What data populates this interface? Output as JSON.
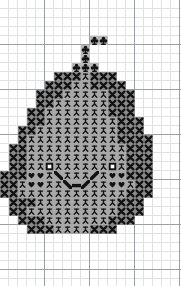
{
  "document": {
    "type": "cross-stitch-chart",
    "title": "Pumpkin Jack-o-Lantern Cross Stitch Chart",
    "width_px": 181,
    "height_px": 286,
    "cell_size_px": 9,
    "grid": {
      "minor_line_color": "#dfe1e3",
      "major_line_color": "#9aa0a6",
      "major_every_cells": 5,
      "columns": 20,
      "rows": 31,
      "show": true
    }
  },
  "legend": {
    "symbols": [
      {
        "key": "x",
        "name": "cross-x-symbol",
        "label": "X",
        "cell_color": "#8a8a8a",
        "ink": "#111111"
      },
      {
        "key": "fig",
        "name": "stick-figure-symbol",
        "label": "Stick figure",
        "cell_color": "#a8a8a8",
        "ink": "#111111"
      },
      {
        "key": "heart",
        "name": "heart-symbol",
        "label": "Heart",
        "cell_color": "#a8a8a8",
        "ink": "#111111"
      },
      {
        "key": "eye",
        "name": "eye-square-symbol",
        "label": "Open square",
        "cell_color": "#a8a8a8",
        "ink": "#ffffff"
      },
      {
        "key": "mouth",
        "name": "mouth-stroke-symbol",
        "label": "Diagonal bar",
        "cell_color": "#a8a8a8",
        "ink": "#111111"
      },
      {
        "key": "club",
        "name": "club-symbol",
        "label": "Club",
        "cell_color": "#b8b8b8",
        "ink": "#111111"
      }
    ]
  },
  "chart_data": {
    "type": "heatmap",
    "xlabel": "",
    "ylabel": "",
    "legend_position": "none",
    "grid": true,
    "origin_x_px": 0,
    "origin_y_px": 0,
    "cell_px": 9,
    "columns": 20,
    "rows": 31,
    "key": {
      "0": "blank",
      "x": "cross",
      "f": "stick-figure",
      "h": "heart",
      "e": "eye",
      "m": "mouth",
      "c": "club"
    },
    "rows_data": [
      "00000000000000000000",
      "00000000000000000000",
      "00000000000000000000",
      "00000000000000000000",
      "0000000000cc00000000",
      "000000000c0000000000",
      "000000000c0000000000",
      "00000000ccc000000000",
      "000000xxxxxxx0000000",
      "00000xxxfffxxx000000",
      "0000xxxfffffxxxx0000",
      "0000xxffffffffxx0000",
      "000xxxffffffffxxx000",
      "000xxfffffffffxxxx00",
      "00xxxffffffffffxxxx0",
      "00xxffffffffffffxx00",
      "00xxffffffffffffxx00",
      "00xxffffffffffffxx00",
      "00xxfefffffffefxxx00",
      "00xfhhfmfffmfhhfxx00",
      "00xfhhffmmmffhhfxx00",
      "00xxfffffffffffxxx00",
      "00xxffffffffffffxx00",
      "0xxxffffffffffxxxxx0",
      "0xxxfffffffffffxxxx0",
      "0xxxffffffffffxxxx00",
      "00xxxffffffffxxxx000",
      "000xxxffffffxxxx0000",
      "00000000000000000000",
      "00000000000000000000",
      "00000000000000000000"
    ],
    "cells": [
      {
        "r": 4,
        "c": 10,
        "s": "c"
      },
      {
        "r": 4,
        "c": 11,
        "s": "c"
      },
      {
        "r": 5,
        "c": 9,
        "s": "c"
      },
      {
        "r": 6,
        "c": 9,
        "s": "c"
      },
      {
        "r": 7,
        "c": 8,
        "s": "c"
      },
      {
        "r": 7,
        "c": 9,
        "s": "c"
      },
      {
        "r": 7,
        "c": 10,
        "s": "c"
      },
      {
        "r": 8,
        "c": 6,
        "s": "x"
      },
      {
        "r": 8,
        "c": 7,
        "s": "x"
      },
      {
        "r": 8,
        "c": 8,
        "s": "x"
      },
      {
        "r": 8,
        "c": 9,
        "s": "f"
      },
      {
        "r": 8,
        "c": 10,
        "s": "x"
      },
      {
        "r": 8,
        "c": 11,
        "s": "x"
      },
      {
        "r": 8,
        "c": 12,
        "s": "x"
      },
      {
        "r": 9,
        "c": 5,
        "s": "x"
      },
      {
        "r": 9,
        "c": 6,
        "s": "x"
      },
      {
        "r": 9,
        "c": 7,
        "s": "x"
      },
      {
        "r": 9,
        "c": 8,
        "s": "f"
      },
      {
        "r": 9,
        "c": 9,
        "s": "f"
      },
      {
        "r": 9,
        "c": 10,
        "s": "x"
      },
      {
        "r": 9,
        "c": 11,
        "s": "x"
      },
      {
        "r": 9,
        "c": 12,
        "s": "x"
      },
      {
        "r": 9,
        "c": 13,
        "s": "x"
      },
      {
        "r": 10,
        "c": 4,
        "s": "x"
      },
      {
        "r": 10,
        "c": 5,
        "s": "x"
      },
      {
        "r": 10,
        "c": 6,
        "s": "x"
      },
      {
        "r": 10,
        "c": 7,
        "s": "f"
      },
      {
        "r": 10,
        "c": 8,
        "s": "f"
      },
      {
        "r": 10,
        "c": 9,
        "s": "f"
      },
      {
        "r": 10,
        "c": 10,
        "s": "f"
      },
      {
        "r": 10,
        "c": 11,
        "s": "f"
      },
      {
        "r": 10,
        "c": 12,
        "s": "x"
      },
      {
        "r": 10,
        "c": 13,
        "s": "x"
      },
      {
        "r": 10,
        "c": 14,
        "s": "x"
      },
      {
        "r": 11,
        "c": 4,
        "s": "x"
      },
      {
        "r": 11,
        "c": 5,
        "s": "x"
      },
      {
        "r": 11,
        "c": 6,
        "s": "f"
      },
      {
        "r": 11,
        "c": 7,
        "s": "f"
      },
      {
        "r": 11,
        "c": 8,
        "s": "f"
      },
      {
        "r": 11,
        "c": 9,
        "s": "f"
      },
      {
        "r": 11,
        "c": 10,
        "s": "f"
      },
      {
        "r": 11,
        "c": 11,
        "s": "f"
      },
      {
        "r": 11,
        "c": 12,
        "s": "x"
      },
      {
        "r": 11,
        "c": 13,
        "s": "x"
      },
      {
        "r": 11,
        "c": 14,
        "s": "x"
      },
      {
        "r": 12,
        "c": 3,
        "s": "x"
      },
      {
        "r": 12,
        "c": 4,
        "s": "x"
      },
      {
        "r": 12,
        "c": 5,
        "s": "f"
      },
      {
        "r": 12,
        "c": 6,
        "s": "f"
      },
      {
        "r": 12,
        "c": 7,
        "s": "f"
      },
      {
        "r": 12,
        "c": 8,
        "s": "f"
      },
      {
        "r": 12,
        "c": 9,
        "s": "f"
      },
      {
        "r": 12,
        "c": 10,
        "s": "f"
      },
      {
        "r": 12,
        "c": 11,
        "s": "f"
      },
      {
        "r": 12,
        "c": 12,
        "s": "x"
      },
      {
        "r": 12,
        "c": 13,
        "s": "x"
      },
      {
        "r": 12,
        "c": 14,
        "s": "x"
      },
      {
        "r": 13,
        "c": 3,
        "s": "x"
      },
      {
        "r": 13,
        "c": 4,
        "s": "x"
      },
      {
        "r": 13,
        "c": 5,
        "s": "f"
      },
      {
        "r": 13,
        "c": 6,
        "s": "f"
      },
      {
        "r": 13,
        "c": 7,
        "s": "f"
      },
      {
        "r": 13,
        "c": 8,
        "s": "f"
      },
      {
        "r": 13,
        "c": 9,
        "s": "f"
      },
      {
        "r": 13,
        "c": 10,
        "s": "f"
      },
      {
        "r": 13,
        "c": 11,
        "s": "f"
      },
      {
        "r": 13,
        "c": 12,
        "s": "f"
      },
      {
        "r": 13,
        "c": 13,
        "s": "x"
      },
      {
        "r": 13,
        "c": 14,
        "s": "x"
      },
      {
        "r": 13,
        "c": 15,
        "s": "x"
      },
      {
        "r": 14,
        "c": 2,
        "s": "x"
      },
      {
        "r": 14,
        "c": 3,
        "s": "x"
      },
      {
        "r": 14,
        "c": 4,
        "s": "f"
      },
      {
        "r": 14,
        "c": 5,
        "s": "f"
      },
      {
        "r": 14,
        "c": 6,
        "s": "f"
      },
      {
        "r": 14,
        "c": 7,
        "s": "f"
      },
      {
        "r": 14,
        "c": 8,
        "s": "f"
      },
      {
        "r": 14,
        "c": 9,
        "s": "f"
      },
      {
        "r": 14,
        "c": 10,
        "s": "f"
      },
      {
        "r": 14,
        "c": 11,
        "s": "f"
      },
      {
        "r": 14,
        "c": 12,
        "s": "f"
      },
      {
        "r": 14,
        "c": 13,
        "s": "x"
      },
      {
        "r": 14,
        "c": 14,
        "s": "x"
      },
      {
        "r": 14,
        "c": 15,
        "s": "x"
      },
      {
        "r": 15,
        "c": 2,
        "s": "x"
      },
      {
        "r": 15,
        "c": 3,
        "s": "f"
      },
      {
        "r": 15,
        "c": 4,
        "s": "f"
      },
      {
        "r": 15,
        "c": 5,
        "s": "f"
      },
      {
        "r": 15,
        "c": 6,
        "s": "f"
      },
      {
        "r": 15,
        "c": 7,
        "s": "f"
      },
      {
        "r": 15,
        "c": 8,
        "s": "f"
      },
      {
        "r": 15,
        "c": 9,
        "s": "f"
      },
      {
        "r": 15,
        "c": 10,
        "s": "f"
      },
      {
        "r": 15,
        "c": 11,
        "s": "f"
      },
      {
        "r": 15,
        "c": 12,
        "s": "f"
      },
      {
        "r": 15,
        "c": 13,
        "s": "x"
      },
      {
        "r": 15,
        "c": 14,
        "s": "x"
      },
      {
        "r": 15,
        "c": 15,
        "s": "x"
      },
      {
        "r": 15,
        "c": 16,
        "s": "x"
      },
      {
        "r": 16,
        "c": 1,
        "s": "x"
      },
      {
        "r": 16,
        "c": 2,
        "s": "x"
      },
      {
        "r": 16,
        "c": 3,
        "s": "f"
      },
      {
        "r": 16,
        "c": 4,
        "s": "f"
      },
      {
        "r": 16,
        "c": 5,
        "s": "f"
      },
      {
        "r": 16,
        "c": 6,
        "s": "f"
      },
      {
        "r": 16,
        "c": 7,
        "s": "f"
      },
      {
        "r": 16,
        "c": 8,
        "s": "f"
      },
      {
        "r": 16,
        "c": 9,
        "s": "f"
      },
      {
        "r": 16,
        "c": 10,
        "s": "f"
      },
      {
        "r": 16,
        "c": 11,
        "s": "f"
      },
      {
        "r": 16,
        "c": 12,
        "s": "f"
      },
      {
        "r": 16,
        "c": 13,
        "s": "f"
      },
      {
        "r": 16,
        "c": 14,
        "s": "x"
      },
      {
        "r": 16,
        "c": 15,
        "s": "x"
      },
      {
        "r": 16,
        "c": 16,
        "s": "x"
      },
      {
        "r": 17,
        "c": 1,
        "s": "x"
      },
      {
        "r": 17,
        "c": 2,
        "s": "x"
      },
      {
        "r": 17,
        "c": 3,
        "s": "f"
      },
      {
        "r": 17,
        "c": 4,
        "s": "f"
      },
      {
        "r": 17,
        "c": 5,
        "s": "f"
      },
      {
        "r": 17,
        "c": 6,
        "s": "f"
      },
      {
        "r": 17,
        "c": 7,
        "s": "f"
      },
      {
        "r": 17,
        "c": 8,
        "s": "f"
      },
      {
        "r": 17,
        "c": 9,
        "s": "f"
      },
      {
        "r": 17,
        "c": 10,
        "s": "f"
      },
      {
        "r": 17,
        "c": 11,
        "s": "f"
      },
      {
        "r": 17,
        "c": 12,
        "s": "f"
      },
      {
        "r": 17,
        "c": 13,
        "s": "f"
      },
      {
        "r": 17,
        "c": 14,
        "s": "x"
      },
      {
        "r": 17,
        "c": 15,
        "s": "x"
      },
      {
        "r": 17,
        "c": 16,
        "s": "x"
      },
      {
        "r": 18,
        "c": 1,
        "s": "x"
      },
      {
        "r": 18,
        "c": 2,
        "s": "x"
      },
      {
        "r": 18,
        "c": 3,
        "s": "f"
      },
      {
        "r": 18,
        "c": 4,
        "s": "f"
      },
      {
        "r": 18,
        "c": 5,
        "s": "e"
      },
      {
        "r": 18,
        "c": 6,
        "s": "f"
      },
      {
        "r": 18,
        "c": 7,
        "s": "f"
      },
      {
        "r": 18,
        "c": 8,
        "s": "f"
      },
      {
        "r": 18,
        "c": 9,
        "s": "f"
      },
      {
        "r": 18,
        "c": 10,
        "s": "f"
      },
      {
        "r": 18,
        "c": 11,
        "s": "f"
      },
      {
        "r": 18,
        "c": 12,
        "s": "e"
      },
      {
        "r": 18,
        "c": 13,
        "s": "f"
      },
      {
        "r": 18,
        "c": 14,
        "s": "x"
      },
      {
        "r": 18,
        "c": 15,
        "s": "x"
      },
      {
        "r": 18,
        "c": 16,
        "s": "x"
      },
      {
        "r": 19,
        "c": 0,
        "s": "x"
      },
      {
        "r": 19,
        "c": 1,
        "s": "x"
      },
      {
        "r": 19,
        "c": 2,
        "s": "x"
      },
      {
        "r": 19,
        "c": 3,
        "s": "h"
      },
      {
        "r": 19,
        "c": 4,
        "s": "h"
      },
      {
        "r": 19,
        "c": 5,
        "s": "f"
      },
      {
        "r": 19,
        "c": 6,
        "s": "m"
      },
      {
        "r": 19,
        "c": 7,
        "s": "f"
      },
      {
        "r": 19,
        "c": 8,
        "s": "f"
      },
      {
        "r": 19,
        "c": 9,
        "s": "f"
      },
      {
        "r": 19,
        "c": 10,
        "s": "m"
      },
      {
        "r": 19,
        "c": 11,
        "s": "f"
      },
      {
        "r": 19,
        "c": 12,
        "s": "h"
      },
      {
        "r": 19,
        "c": 13,
        "s": "h"
      },
      {
        "r": 19,
        "c": 14,
        "s": "x"
      },
      {
        "r": 19,
        "c": 15,
        "s": "x"
      },
      {
        "r": 19,
        "c": 16,
        "s": "x"
      },
      {
        "r": 20,
        "c": 0,
        "s": "x"
      },
      {
        "r": 20,
        "c": 1,
        "s": "x"
      },
      {
        "r": 20,
        "c": 2,
        "s": "f"
      },
      {
        "r": 20,
        "c": 3,
        "s": "h"
      },
      {
        "r": 20,
        "c": 4,
        "s": "h"
      },
      {
        "r": 20,
        "c": 5,
        "s": "f"
      },
      {
        "r": 20,
        "c": 6,
        "s": "f"
      },
      {
        "r": 20,
        "c": 7,
        "s": "m"
      },
      {
        "r": 20,
        "c": 8,
        "s": "m"
      },
      {
        "r": 20,
        "c": 9,
        "s": "m"
      },
      {
        "r": 20,
        "c": 10,
        "s": "f"
      },
      {
        "r": 20,
        "c": 11,
        "s": "f"
      },
      {
        "r": 20,
        "c": 12,
        "s": "h"
      },
      {
        "r": 20,
        "c": 13,
        "s": "h"
      },
      {
        "r": 20,
        "c": 14,
        "s": "f"
      },
      {
        "r": 20,
        "c": 15,
        "s": "x"
      },
      {
        "r": 20,
        "c": 16,
        "s": "x"
      },
      {
        "r": 21,
        "c": 0,
        "s": "x"
      },
      {
        "r": 21,
        "c": 1,
        "s": "x"
      },
      {
        "r": 21,
        "c": 2,
        "s": "f"
      },
      {
        "r": 21,
        "c": 3,
        "s": "f"
      },
      {
        "r": 21,
        "c": 4,
        "s": "f"
      },
      {
        "r": 21,
        "c": 5,
        "s": "f"
      },
      {
        "r": 21,
        "c": 6,
        "s": "f"
      },
      {
        "r": 21,
        "c": 7,
        "s": "f"
      },
      {
        "r": 21,
        "c": 8,
        "s": "f"
      },
      {
        "r": 21,
        "c": 9,
        "s": "f"
      },
      {
        "r": 21,
        "c": 10,
        "s": "f"
      },
      {
        "r": 21,
        "c": 11,
        "s": "f"
      },
      {
        "r": 21,
        "c": 12,
        "s": "f"
      },
      {
        "r": 21,
        "c": 13,
        "s": "f"
      },
      {
        "r": 21,
        "c": 14,
        "s": "x"
      },
      {
        "r": 21,
        "c": 15,
        "s": "x"
      },
      {
        "r": 21,
        "c": 16,
        "s": "x"
      },
      {
        "r": 22,
        "c": 1,
        "s": "x"
      },
      {
        "r": 22,
        "c": 2,
        "s": "x"
      },
      {
        "r": 22,
        "c": 3,
        "s": "x"
      },
      {
        "r": 22,
        "c": 4,
        "s": "f"
      },
      {
        "r": 22,
        "c": 5,
        "s": "f"
      },
      {
        "r": 22,
        "c": 6,
        "s": "f"
      },
      {
        "r": 22,
        "c": 7,
        "s": "f"
      },
      {
        "r": 22,
        "c": 8,
        "s": "f"
      },
      {
        "r": 22,
        "c": 9,
        "s": "f"
      },
      {
        "r": 22,
        "c": 10,
        "s": "f"
      },
      {
        "r": 22,
        "c": 11,
        "s": "f"
      },
      {
        "r": 22,
        "c": 12,
        "s": "f"
      },
      {
        "r": 22,
        "c": 13,
        "s": "x"
      },
      {
        "r": 22,
        "c": 14,
        "s": "x"
      },
      {
        "r": 22,
        "c": 15,
        "s": "x"
      },
      {
        "r": 23,
        "c": 1,
        "s": "x"
      },
      {
        "r": 23,
        "c": 2,
        "s": "x"
      },
      {
        "r": 23,
        "c": 3,
        "s": "f"
      },
      {
        "r": 23,
        "c": 4,
        "s": "f"
      },
      {
        "r": 23,
        "c": 5,
        "s": "f"
      },
      {
        "r": 23,
        "c": 6,
        "s": "f"
      },
      {
        "r": 23,
        "c": 7,
        "s": "f"
      },
      {
        "r": 23,
        "c": 8,
        "s": "f"
      },
      {
        "r": 23,
        "c": 9,
        "s": "f"
      },
      {
        "r": 23,
        "c": 10,
        "s": "f"
      },
      {
        "r": 23,
        "c": 11,
        "s": "f"
      },
      {
        "r": 23,
        "c": 12,
        "s": "f"
      },
      {
        "r": 23,
        "c": 13,
        "s": "x"
      },
      {
        "r": 23,
        "c": 14,
        "s": "x"
      },
      {
        "r": 23,
        "c": 15,
        "s": "x"
      },
      {
        "r": 24,
        "c": 2,
        "s": "x"
      },
      {
        "r": 24,
        "c": 3,
        "s": "x"
      },
      {
        "r": 24,
        "c": 4,
        "s": "x"
      },
      {
        "r": 24,
        "c": 5,
        "s": "f"
      },
      {
        "r": 24,
        "c": 6,
        "s": "f"
      },
      {
        "r": 24,
        "c": 7,
        "s": "f"
      },
      {
        "r": 24,
        "c": 8,
        "s": "f"
      },
      {
        "r": 24,
        "c": 9,
        "s": "f"
      },
      {
        "r": 24,
        "c": 10,
        "s": "f"
      },
      {
        "r": 24,
        "c": 11,
        "s": "f"
      },
      {
        "r": 24,
        "c": 12,
        "s": "x"
      },
      {
        "r": 24,
        "c": 13,
        "s": "x"
      },
      {
        "r": 24,
        "c": 14,
        "s": "x"
      },
      {
        "r": 25,
        "c": 3,
        "s": "x"
      },
      {
        "r": 25,
        "c": 4,
        "s": "x"
      },
      {
        "r": 25,
        "c": 5,
        "s": "x"
      },
      {
        "r": 25,
        "c": 6,
        "s": "f"
      },
      {
        "r": 25,
        "c": 7,
        "s": "f"
      },
      {
        "r": 25,
        "c": 8,
        "s": "f"
      },
      {
        "r": 25,
        "c": 9,
        "s": "f"
      },
      {
        "r": 25,
        "c": 10,
        "s": "x"
      },
      {
        "r": 25,
        "c": 11,
        "s": "x"
      },
      {
        "r": 25,
        "c": 12,
        "s": "x"
      }
    ]
  }
}
